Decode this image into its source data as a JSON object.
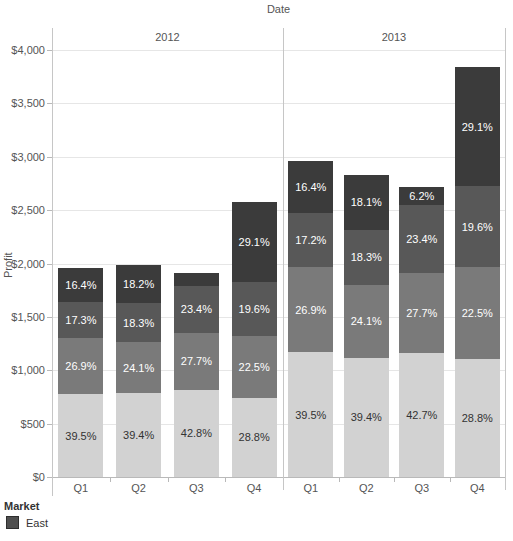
{
  "chart_data": {
    "type": "bar",
    "stacked": true,
    "title": "Date",
    "ylabel": "Profit",
    "ylim": [
      0,
      4000
    ],
    "ytick_values": [
      0,
      500,
      1000,
      1500,
      2000,
      2500,
      3000,
      3500,
      4000
    ],
    "ytick_labels": [
      "$0",
      "$500",
      "$1,000",
      "$1,500",
      "$2,000",
      "$2,500",
      "$3,000",
      "$3,500",
      "$4,000"
    ],
    "grid": true,
    "legend": {
      "title": "Market",
      "position": "bottom-left",
      "entries": [
        {
          "label": "East",
          "color": "#4f4f4f"
        }
      ]
    },
    "segment_colors_bottom_to_top": [
      "#d2d2d2",
      "#7a7a7a",
      "#585858",
      "#3b3b3b"
    ],
    "segment_label_colors_bottom_to_top": [
      "#333333",
      "#ffffff",
      "#ffffff",
      "#ffffff"
    ],
    "groups": [
      {
        "year": "2012",
        "bars": [
          {
            "quarter": "Q1",
            "total": 1960,
            "segments": [
              {
                "pct": 39.5,
                "label": "39.5%"
              },
              {
                "pct": 26.9,
                "label": "26.9%"
              },
              {
                "pct": 17.3,
                "label": "17.3%"
              },
              {
                "pct": 16.4,
                "label": "16.4%"
              }
            ]
          },
          {
            "quarter": "Q2",
            "total": 1990,
            "segments": [
              {
                "pct": 39.4,
                "label": "39.4%"
              },
              {
                "pct": 24.1,
                "label": "24.1%"
              },
              {
                "pct": 18.3,
                "label": "18.3%"
              },
              {
                "pct": 18.2,
                "label": "18.2%"
              }
            ]
          },
          {
            "quarter": "Q3",
            "total": 1910,
            "segments": [
              {
                "pct": 42.8,
                "label": "42.8%"
              },
              {
                "pct": 27.7,
                "label": "27.7%"
              },
              {
                "pct": 23.4,
                "label": "23.4%"
              },
              {
                "pct": 6.1,
                "label": null
              }
            ]
          },
          {
            "quarter": "Q4",
            "total": 2580,
            "segments": [
              {
                "pct": 28.8,
                "label": "28.8%"
              },
              {
                "pct": 22.5,
                "label": "22.5%"
              },
              {
                "pct": 19.6,
                "label": "19.6%"
              },
              {
                "pct": 29.1,
                "label": "29.1%"
              }
            ]
          }
        ]
      },
      {
        "year": "2013",
        "bars": [
          {
            "quarter": "Q1",
            "total": 2960,
            "segments": [
              {
                "pct": 39.5,
                "label": "39.5%"
              },
              {
                "pct": 26.9,
                "label": "26.9%"
              },
              {
                "pct": 17.2,
                "label": "17.2%"
              },
              {
                "pct": 16.4,
                "label": "16.4%"
              }
            ]
          },
          {
            "quarter": "Q2",
            "total": 2830,
            "segments": [
              {
                "pct": 39.4,
                "label": "39.4%"
              },
              {
                "pct": 24.1,
                "label": "24.1%"
              },
              {
                "pct": 18.3,
                "label": "18.3%"
              },
              {
                "pct": 18.1,
                "label": "18.1%"
              }
            ]
          },
          {
            "quarter": "Q3",
            "total": 2720,
            "segments": [
              {
                "pct": 42.7,
                "label": "42.7%"
              },
              {
                "pct": 27.7,
                "label": "27.7%"
              },
              {
                "pct": 23.4,
                "label": "23.4%"
              },
              {
                "pct": 6.2,
                "label": "6.2%"
              }
            ]
          },
          {
            "quarter": "Q4",
            "total": 3840,
            "segments": [
              {
                "pct": 28.8,
                "label": "28.8%"
              },
              {
                "pct": 22.5,
                "label": "22.5%"
              },
              {
                "pct": 19.6,
                "label": "19.6%"
              },
              {
                "pct": 29.1,
                "label": "29.1%"
              }
            ]
          }
        ]
      }
    ]
  }
}
